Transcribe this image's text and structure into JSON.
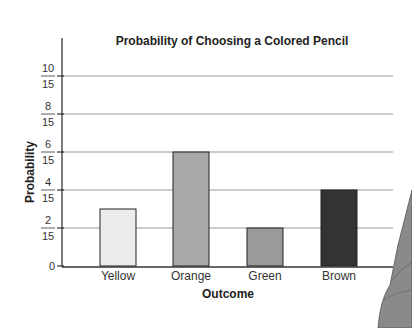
{
  "chart_data": {
    "type": "bar",
    "title": "Probability of Choosing a Colored Pencil",
    "xlabel": "Outcome",
    "ylabel": "Probability",
    "categories": [
      "Yellow",
      "Orange",
      "Green",
      "Brown"
    ],
    "values": [
      0.2,
      0.4,
      0.1333,
      0.2667
    ],
    "values_fraction": [
      "3/15",
      "6/15",
      "2/15",
      "4/15"
    ],
    "bar_colors": [
      "#ececec",
      "#a9a9a9",
      "#9a9a9a",
      "#333333"
    ],
    "ylim": [
      0,
      0.7333
    ],
    "yticks": [
      {
        "value": 0,
        "num": "0",
        "den": ""
      },
      {
        "value": 0.1333,
        "num": "2",
        "den": "15"
      },
      {
        "value": 0.2667,
        "num": "4",
        "den": "15"
      },
      {
        "value": 0.4,
        "num": "6",
        "den": "15"
      },
      {
        "value": 0.5333,
        "num": "8",
        "den": "15"
      },
      {
        "value": 0.6667,
        "num": "10",
        "den": "15"
      }
    ],
    "grid": true,
    "legend": "none"
  }
}
